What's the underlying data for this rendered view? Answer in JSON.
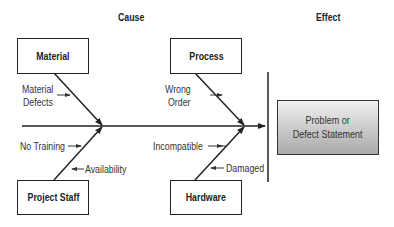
{
  "headers": {
    "cause": "Cause",
    "effect": "Effect"
  },
  "categories": {
    "material": "Material",
    "process": "Process",
    "project_staff": "Project Staff",
    "hardware": "Hardware"
  },
  "causes": {
    "material_defects_1": "Material",
    "material_defects_2": "Defects",
    "wrong_order_1": "Wrong",
    "wrong_order_2": "Order",
    "no_training": "No Training",
    "availability": "Availability",
    "incompatible": "Incompatible",
    "damaged": "Damaged"
  },
  "effect": {
    "line1": "Problem or",
    "line2": "Defect Statement"
  },
  "colors": {
    "line": "#222222",
    "effect_top": "#f0f0f0",
    "effect_bottom": "#a9a9a9"
  }
}
